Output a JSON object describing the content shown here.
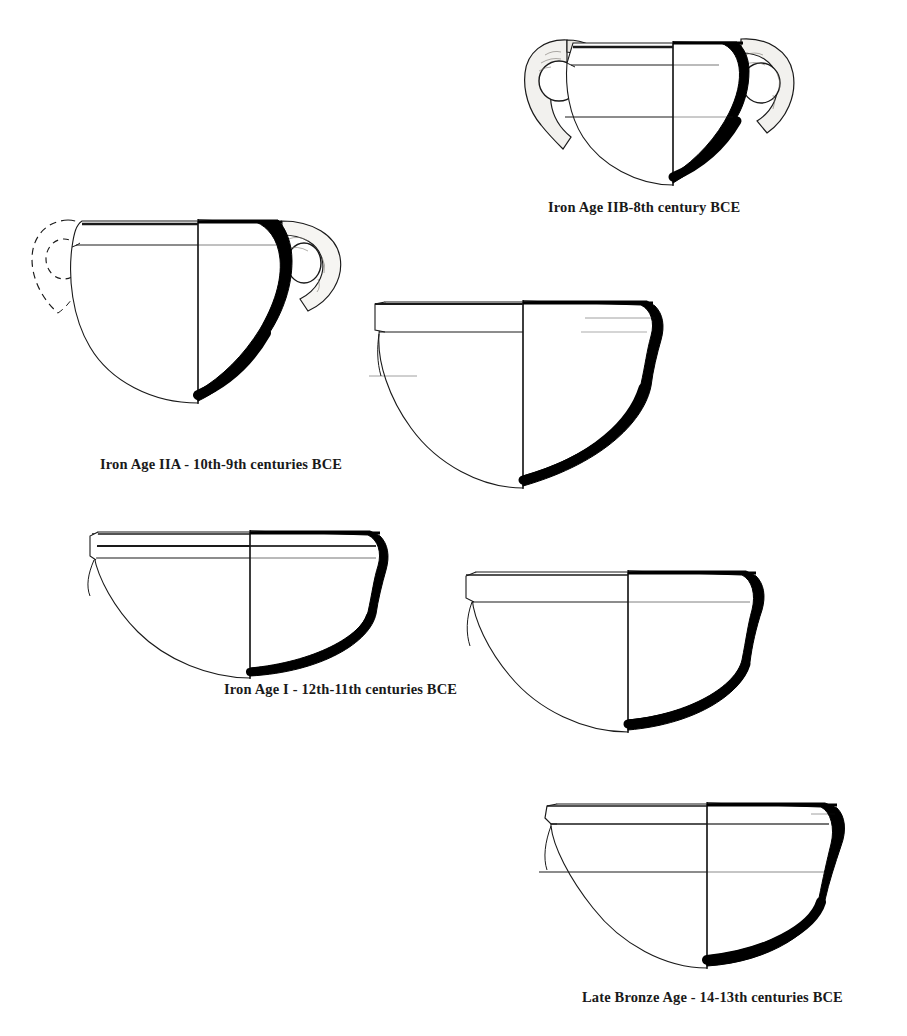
{
  "figure": {
    "kind": "archaeological-pottery-typology-plate",
    "medium": "line-drawing",
    "background_color": "#ffffff",
    "ink_color": "#1a1a1a",
    "section_fill_color": "#000000",
    "drawing_convention": "left half exterior profile outline, right half drawn section filled solid black, vertical centerline axis",
    "vessel_count": 5,
    "caption_count": 4
  },
  "vessels": [
    {
      "id": "vessel-iron-age-iib",
      "period": "Iron Age IIB",
      "date": "8th century BCE",
      "caption": "Iron Age IIB-8th century BCE",
      "handles": 2,
      "handle_style": "loop-handle-stippled",
      "left_handle_reconstructed": false,
      "rim": "everted-banded-rim",
      "body": "globular",
      "neck_bands": 2
    },
    {
      "id": "vessel-iron-age-iia",
      "period": "Iron Age IIA",
      "date": "10th-9th centuries BCE",
      "caption": "Iron Age IIA - 10th-9th centuries BCE",
      "handles": 2,
      "handle_style": "loop-handle-stippled",
      "left_handle_reconstructed": true,
      "rim": "flat-everted-rim",
      "body": "broad-globular",
      "neck_bands": 1
    },
    {
      "id": "vessel-iron-age-iia-secondary",
      "period": "Iron Age IIA",
      "date": "10th-9th centuries BCE",
      "caption": null,
      "handles": 0,
      "handle_style": "none",
      "left_handle_reconstructed": false,
      "rim": "flaring-triangular-rim",
      "body": "carinated-globular",
      "neck_bands": 1
    },
    {
      "id": "vessel-iron-age-i",
      "period": "Iron Age I",
      "date": "12th-11th centuries BCE",
      "caption": "Iron Age I - 12th-11th centuries BCE",
      "handles": 0,
      "handle_style": "none",
      "left_handle_reconstructed": false,
      "rim": "double-grooved-everted-rim",
      "body": "shallow-carinated",
      "neck_bands": 2
    },
    {
      "id": "vessel-late-bronze-age",
      "period": "Late Bronze Age",
      "date": "14-13th centuries BCE",
      "caption": "Late Bronze Age - 14-13th centuries BCE",
      "handles": 0,
      "handle_style": "none",
      "left_handle_reconstructed": false,
      "rim": "thickened-everted-rim",
      "body": "deep-rounded",
      "neck_bands": 1
    }
  ],
  "captions": {
    "iron_age_iib": "Iron Age IIB-8th century BCE",
    "iron_age_iia": "Iron Age IIA - 10th-9th centuries BCE",
    "iron_age_i": "Iron Age I - 12th-11th centuries BCE",
    "late_bronze_age": "Late Bronze Age - 14-13th centuries BCE"
  }
}
